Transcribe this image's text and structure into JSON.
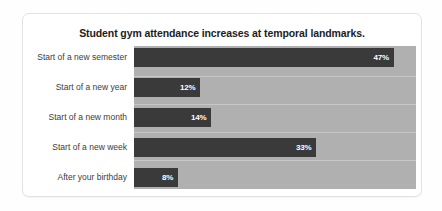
{
  "chart_data": {
    "type": "bar",
    "orientation": "horizontal",
    "title": "Student gym attendance increases at temporal landmarks.",
    "xlabel": "",
    "ylabel": "",
    "xlim": [
      0,
      51
    ],
    "grid": true,
    "legend": "none",
    "categories": [
      "Start of a new semester",
      "Start of a new year",
      "Start of a new month",
      "Start of a new week",
      "After your birthday"
    ],
    "values": [
      47,
      12,
      14,
      33,
      8
    ],
    "value_labels": [
      "47%",
      "12%",
      "14%",
      "33%",
      "8%"
    ],
    "colors": {
      "bar": "#3a3a3a",
      "plot_background": "#b0b0b0",
      "card_background": "#ffffff",
      "card_border": "#e3e3e3",
      "title_text": "#1d1d1d",
      "category_text": "#3c3c3c",
      "value_text": "#ffffff"
    }
  }
}
